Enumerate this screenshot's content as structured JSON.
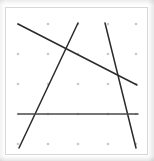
{
  "figure": {
    "panel": {
      "x": 5,
      "y": 7,
      "width": 143,
      "height": 148,
      "background_color": "#ffffff",
      "border_color": "#d8d8d8"
    },
    "dot_grid": {
      "label": "dot-grid",
      "columns_x": [
        18,
        48,
        78,
        108,
        136
      ],
      "rows_y": [
        24,
        54,
        84,
        114,
        144
      ],
      "dot_color": "#c9c9c9",
      "dot_radius": 1.3,
      "count": 25
    },
    "lines": [
      {
        "name": "descending-diagonal-line",
        "x1": 18,
        "y1": 24,
        "x2": 137,
        "y2": 85,
        "color": "#2b2b2b",
        "width": 1.5
      },
      {
        "name": "left-steep-line",
        "x1": 78,
        "y1": 23,
        "x2": 19,
        "y2": 148,
        "color": "#2b2b2b",
        "width": 1.5
      },
      {
        "name": "right-steep-line",
        "x1": 105,
        "y1": 23,
        "x2": 136,
        "y2": 148,
        "color": "#2b2b2b",
        "width": 1.5
      },
      {
        "name": "horizontal-line",
        "x1": 18,
        "y1": 114,
        "x2": 138,
        "y2": 114,
        "color": "#4a4a4a",
        "width": 1.5
      }
    ]
  },
  "chart_data": {
    "type": "scatter",
    "title": "",
    "xlabel": "",
    "ylabel": "",
    "xlim": [
      0,
      154
    ],
    "ylim": [
      161,
      0
    ],
    "grid": true,
    "legend": "none",
    "grid_points": {
      "x": [
        18,
        48,
        78,
        108,
        136,
        18,
        48,
        78,
        108,
        136,
        18,
        48,
        78,
        108,
        136,
        18,
        48,
        78,
        108,
        136,
        18,
        48,
        78,
        108,
        136
      ],
      "y": [
        24,
        24,
        24,
        24,
        24,
        54,
        54,
        54,
        54,
        54,
        84,
        84,
        84,
        84,
        84,
        114,
        114,
        114,
        114,
        114,
        144,
        144,
        144,
        144,
        144
      ]
    },
    "annotations": [
      {
        "name": "descending-diagonal-line",
        "from": [
          18,
          24
        ],
        "to": [
          137,
          85
        ]
      },
      {
        "name": "left-steep-line",
        "from": [
          78,
          23
        ],
        "to": [
          19,
          148
        ]
      },
      {
        "name": "right-steep-line",
        "from": [
          105,
          23
        ],
        "to": [
          136,
          148
        ]
      },
      {
        "name": "horizontal-line",
        "from": [
          18,
          114
        ],
        "to": [
          138,
          114
        ]
      }
    ]
  }
}
